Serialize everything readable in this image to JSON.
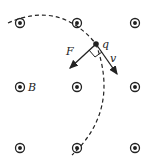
{
  "diagram": {
    "type": "physics-magnetic-field",
    "field_symbol": "dot-in-circle (out of page)",
    "grid": {
      "rows": 3,
      "cols": 3,
      "points": [
        [
          20,
          23
        ],
        [
          77,
          23
        ],
        [
          135,
          23
        ],
        [
          20,
          87
        ],
        [
          77,
          87
        ],
        [
          135,
          87
        ],
        [
          20,
          148
        ],
        [
          77,
          148
        ],
        [
          135,
          148
        ]
      ]
    },
    "labels": {
      "field": "B",
      "charge": "q",
      "force": "F",
      "velocity": "v"
    },
    "charge_position": [
      96,
      44
    ],
    "colors": {
      "ink": "#222222",
      "background": "#ffffff"
    }
  }
}
